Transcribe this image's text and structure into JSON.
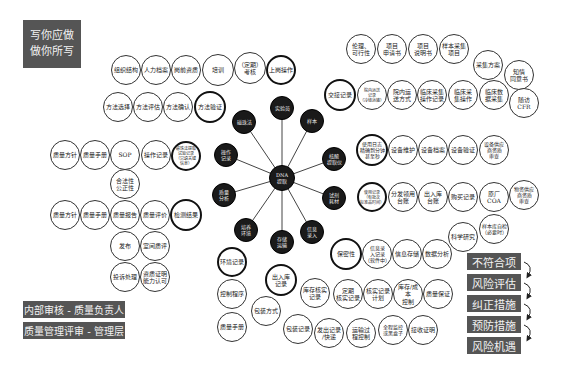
{
  "title_box": {
    "line1": "写你应做",
    "line2": "做你所写"
  },
  "hub": {
    "center": {
      "label": "DNA\n提取",
      "x": 282,
      "y": 178,
      "r": 13
    },
    "spokes": [
      {
        "label": "实验员",
        "x": 282,
        "y": 108,
        "r": 12
      },
      {
        "label": "样本",
        "x": 312,
        "y": 121,
        "r": 12
      },
      {
        "label": "核酸\n提取仪",
        "x": 334,
        "y": 159,
        "r": 12
      },
      {
        "label": "试剂\n耗材",
        "x": 334,
        "y": 198,
        "r": 12
      },
      {
        "label": "信息\n录入",
        "x": 312,
        "y": 232,
        "r": 12
      },
      {
        "label": "存储\n运输",
        "x": 282,
        "y": 242,
        "r": 12
      },
      {
        "label": "培养\n环境",
        "x": 246,
        "y": 230,
        "r": 12
      },
      {
        "label": "质量\n分析",
        "x": 224,
        "y": 195,
        "r": 12
      },
      {
        "label": "操作\n记录",
        "x": 226,
        "y": 155,
        "r": 12
      },
      {
        "label": "磁珠法",
        "x": 244,
        "y": 122,
        "r": 12
      }
    ]
  },
  "circles": [
    {
      "label": "组织结构",
      "x": 126,
      "y": 70,
      "r": 15,
      "fs": 6
    },
    {
      "label": "人力档案",
      "x": 156,
      "y": 70,
      "r": 15,
      "fs": 6
    },
    {
      "label": "岗前资质",
      "x": 186,
      "y": 70,
      "r": 15,
      "fs": 6
    },
    {
      "label": "培训",
      "x": 218,
      "y": 70,
      "r": 16,
      "fs": 6
    },
    {
      "label": "（定期）\n考核",
      "x": 250,
      "y": 68,
      "r": 16,
      "fs": 6
    },
    {
      "label": "上岗操作",
      "x": 281,
      "y": 70,
      "r": 15,
      "fs": 6,
      "bold": true
    },
    {
      "label": "方法选择",
      "x": 118,
      "y": 107,
      "r": 15,
      "fs": 6
    },
    {
      "label": "方法评估",
      "x": 148,
      "y": 107,
      "r": 15,
      "fs": 6
    },
    {
      "label": "方法确认",
      "x": 178,
      "y": 107,
      "r": 15,
      "fs": 6
    },
    {
      "label": "方法验证",
      "x": 210,
      "y": 107,
      "r": 16,
      "fs": 6,
      "bold": true
    },
    {
      "label": "质量方针",
      "x": 65,
      "y": 155,
      "r": 15,
      "fs": 6
    },
    {
      "label": "质量手册",
      "x": 95,
      "y": 155,
      "r": 15,
      "fs": 6
    },
    {
      "label": "SOP",
      "x": 125,
      "y": 155,
      "r": 15,
      "fs": 6
    },
    {
      "label": "操作记录",
      "x": 156,
      "y": 155,
      "r": 15,
      "fs": 6
    },
    {
      "label": "磁珠法提取\n试验记录\n（只填关键\n信息）",
      "x": 186,
      "y": 156,
      "r": 15,
      "fs": 4,
      "bold": true
    },
    {
      "label": "合法性\n公正性",
      "x": 125,
      "y": 184,
      "r": 15,
      "fs": 6
    },
    {
      "label": "质量方针",
      "x": 65,
      "y": 215,
      "r": 15,
      "fs": 6
    },
    {
      "label": "质量手册",
      "x": 95,
      "y": 215,
      "r": 15,
      "fs": 6
    },
    {
      "label": "质量报告",
      "x": 125,
      "y": 215,
      "r": 15,
      "fs": 6
    },
    {
      "label": "质量评价",
      "x": 155,
      "y": 215,
      "r": 15,
      "fs": 6
    },
    {
      "label": "检测结果",
      "x": 186,
      "y": 215,
      "r": 16,
      "fs": 6,
      "bold": true
    },
    {
      "label": "发布",
      "x": 125,
      "y": 246,
      "r": 15,
      "fs": 6
    },
    {
      "label": "室间质评",
      "x": 155,
      "y": 246,
      "r": 15,
      "fs": 6
    },
    {
      "label": "投诉处理",
      "x": 125,
      "y": 277,
      "r": 15,
      "fs": 6
    },
    {
      "label": "资质证明\n能力认可",
      "x": 155,
      "y": 277,
      "r": 15,
      "fs": 6
    },
    {
      "label": "伦理、\n可行性",
      "x": 361,
      "y": 49,
      "r": 15,
      "fs": 6
    },
    {
      "label": "项目\n申请书",
      "x": 392,
      "y": 49,
      "r": 15,
      "fs": 6
    },
    {
      "label": "项目\n说明书",
      "x": 423,
      "y": 49,
      "r": 15,
      "fs": 6
    },
    {
      "label": "样本采集\n项目",
      "x": 454,
      "y": 49,
      "r": 15,
      "fs": 6
    },
    {
      "label": "采集方案",
      "x": 488,
      "y": 65,
      "r": 15,
      "fs": 6
    },
    {
      "label": "知情\n同意书",
      "x": 519,
      "y": 75,
      "r": 15,
      "fs": 6
    },
    {
      "label": "交接记录",
      "x": 340,
      "y": 95,
      "r": 16,
      "fs": 6,
      "bold": true
    },
    {
      "label": "院内运送\n记录\n（冷链运输）",
      "x": 372,
      "y": 95,
      "r": 15,
      "fs": 4
    },
    {
      "label": "院内运\n送方式",
      "x": 402,
      "y": 95,
      "r": 15,
      "fs": 6
    },
    {
      "label": "临床采集\n操作记录",
      "x": 432,
      "y": 95,
      "r": 15,
      "fs": 6
    },
    {
      "label": "临床采\n集操作",
      "x": 463,
      "y": 95,
      "r": 15,
      "fs": 6
    },
    {
      "label": "临床数\n据采集",
      "x": 494,
      "y": 95,
      "r": 15,
      "fs": 6
    },
    {
      "label": "随访 CFR",
      "x": 524,
      "y": 103,
      "r": 15,
      "fs": 6
    },
    {
      "label": "使用日志\n精确到分钟\n甚至秒",
      "x": 372,
      "y": 150,
      "r": 16,
      "fs": 5,
      "bold": true
    },
    {
      "label": "设备维护",
      "x": 403,
      "y": 150,
      "r": 15,
      "fs": 6
    },
    {
      "label": "设备档案",
      "x": 433,
      "y": 150,
      "r": 15,
      "fs": 6
    },
    {
      "label": "设备验证",
      "x": 463,
      "y": 150,
      "r": 15,
      "fs": 6
    },
    {
      "label": "设备供应\n商资质\n审查",
      "x": 494,
      "y": 150,
      "r": 15,
      "fs": 5
    },
    {
      "label": "使用记录\n（有批次\n标准品时间）",
      "x": 372,
      "y": 197,
      "r": 15,
      "fs": 4,
      "bold": true
    },
    {
      "label": "分发领用\n台账",
      "x": 403,
      "y": 197,
      "r": 15,
      "fs": 6
    },
    {
      "label": "出入库\n台账",
      "x": 433,
      "y": 197,
      "r": 15,
      "fs": 6
    },
    {
      "label": "购买记录",
      "x": 463,
      "y": 197,
      "r": 15,
      "fs": 6
    },
    {
      "label": "原厂 COA",
      "x": 494,
      "y": 197,
      "r": 15,
      "fs": 6
    },
    {
      "label": "物资供应\n商资质\n审查",
      "x": 524,
      "y": 195,
      "r": 15,
      "fs": 5
    },
    {
      "label": "科学研究",
      "x": 463,
      "y": 237,
      "r": 15,
      "fs": 6
    },
    {
      "label": "样本库自检\n（必要时）",
      "x": 494,
      "y": 229,
      "r": 15,
      "fs": 5
    },
    {
      "label": "保密性",
      "x": 346,
      "y": 254,
      "r": 16,
      "fs": 6,
      "bold": true
    },
    {
      "label": "信息录\n入记录\n（软件中）",
      "x": 377,
      "y": 254,
      "r": 15,
      "fs": 5
    },
    {
      "label": "信息存储",
      "x": 407,
      "y": 254,
      "r": 15,
      "fs": 6
    },
    {
      "label": "数据分析",
      "x": 437,
      "y": 254,
      "r": 15,
      "fs": 6
    },
    {
      "label": "定期\n核实记录",
      "x": 348,
      "y": 294,
      "r": 15,
      "fs": 6
    },
    {
      "label": "核实记录\n计划",
      "x": 378,
      "y": 294,
      "r": 15,
      "fs": 6
    },
    {
      "label": "库存/成本\n控制",
      "x": 408,
      "y": 294,
      "r": 15,
      "fs": 6
    },
    {
      "label": "质量保证",
      "x": 438,
      "y": 294,
      "r": 15,
      "fs": 6
    },
    {
      "label": "全程监控\n或黑盒子",
      "x": 393,
      "y": 330,
      "r": 15,
      "fs": 5
    },
    {
      "label": "接收证明",
      "x": 423,
      "y": 330,
      "r": 15,
      "fs": 6
    },
    {
      "label": "环境记录",
      "x": 232,
      "y": 262,
      "r": 15,
      "fs": 6,
      "bold": true
    },
    {
      "label": "控制程序",
      "x": 232,
      "y": 294,
      "r": 15,
      "fs": 6
    },
    {
      "label": "质量手册",
      "x": 232,
      "y": 327,
      "r": 15,
      "fs": 6
    },
    {
      "label": "出入库\n记录",
      "x": 281,
      "y": 280,
      "r": 16,
      "fs": 6,
      "bold": true
    },
    {
      "label": "库存核实\n记录",
      "x": 315,
      "y": 293,
      "r": 15,
      "fs": 6
    },
    {
      "label": "包装方式",
      "x": 266,
      "y": 311,
      "r": 15,
      "fs": 6
    },
    {
      "label": "包装记录",
      "x": 298,
      "y": 329,
      "r": 15,
      "fs": 6
    },
    {
      "label": "发出记录\n/快递",
      "x": 329,
      "y": 333,
      "r": 15,
      "fs": 6
    },
    {
      "label": "运输过\n程控制",
      "x": 361,
      "y": 333,
      "r": 15,
      "fs": 6
    }
  ],
  "left_boxes": [
    {
      "label": "内部审核 - 质量负责人"
    },
    {
      "label": "质量管理评审 - 管理层"
    }
  ],
  "risk_chain": [
    {
      "label": "不符合项"
    },
    {
      "label": "风险评估"
    },
    {
      "label": "纠正措施"
    },
    {
      "label": "预防措施"
    },
    {
      "label": "风险机遇"
    }
  ],
  "colors": {
    "box_bg": "#555555",
    "box_text": "#f2f2f2",
    "dark_node": "#1a1a1a",
    "line": "#444444"
  }
}
